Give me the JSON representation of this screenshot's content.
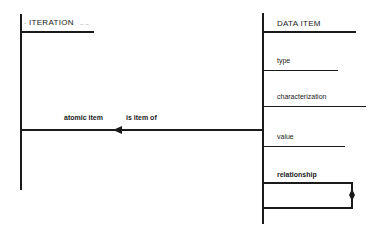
{
  "diagram": {
    "entities": [
      {
        "id": "iteration",
        "title": "ITERATION",
        "title_prefix": ".",
        "title_suffix": "_ _"
      },
      {
        "id": "data_item",
        "title": "DATA ITEM",
        "attributes": [
          {
            "label": "type"
          },
          {
            "label": "characterization"
          },
          {
            "label": "value"
          }
        ],
        "relationship": {
          "label": "relationship"
        }
      }
    ],
    "connection": {
      "from": "DATA ITEM",
      "to": "ITERATION",
      "role_near_target": "atomic item",
      "role_label": "is item of",
      "arrow_direction": "left"
    },
    "colors": {
      "ink": "#1a1a1a",
      "background": "#ffffff"
    }
  }
}
